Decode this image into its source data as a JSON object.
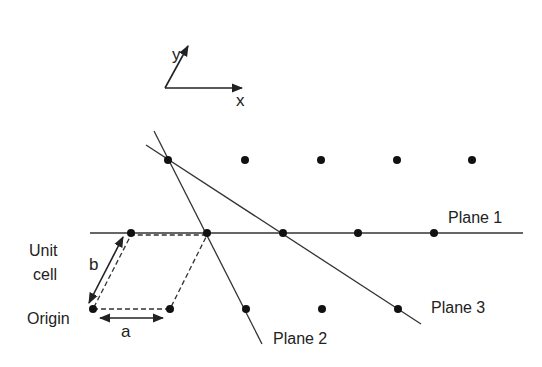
{
  "axes": {
    "x_label": "x",
    "y_label": "y"
  },
  "labels": {
    "plane1": "Plane 1",
    "plane2": "Plane 2",
    "plane3": "Plane 3",
    "unit_cell_line1": "Unit",
    "unit_cell_line2": "cell",
    "origin": "Origin",
    "vector_a": "a",
    "vector_b": "b"
  },
  "colors": {
    "ink": "#222222",
    "background": "#ffffff"
  },
  "lattice": {
    "rows": [
      {
        "y": 160,
        "x": [
          168,
          245,
          321,
          397,
          472
        ]
      },
      {
        "y": 233,
        "x": [
          131,
          207,
          283,
          358,
          434
        ]
      },
      {
        "y": 309,
        "x": [
          93,
          170,
          246,
          322,
          398
        ]
      }
    ]
  }
}
